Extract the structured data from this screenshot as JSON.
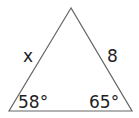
{
  "diagram": {
    "type": "triangle",
    "side_labels": {
      "left": "x",
      "right": "8"
    },
    "angle_labels": {
      "bottom_left": "58°",
      "bottom_right": "65°"
    },
    "colors": {
      "stroke": "#666666",
      "text": "#222222",
      "background": "#ffffff"
    }
  }
}
